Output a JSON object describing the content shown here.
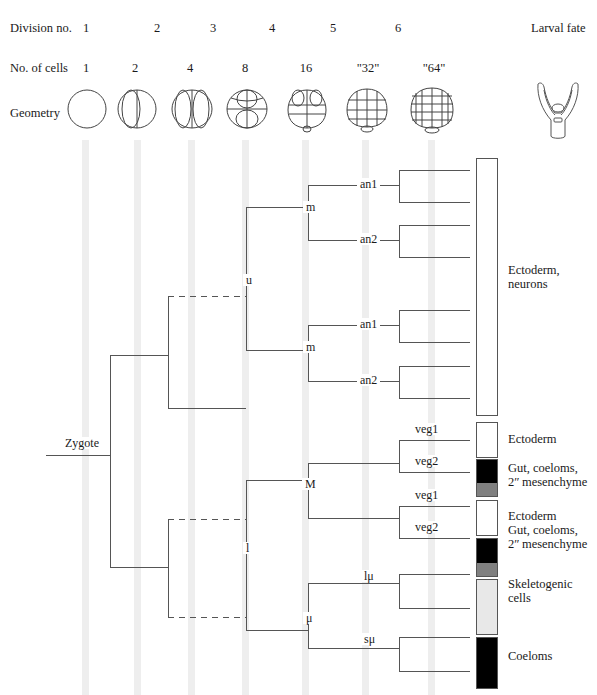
{
  "header": {
    "row_labels": {
      "division": "Division no.",
      "cells": "No. of cells",
      "geometry": "Geometry",
      "larval_fate": "Larval fate"
    },
    "division_numbers": [
      "1",
      "2",
      "3",
      "4",
      "5",
      "6"
    ],
    "cell_counts": [
      "1",
      "2",
      "4",
      "8",
      "16",
      "\"32\"",
      "\"64\""
    ]
  },
  "tree": {
    "root_label": "Zygote",
    "nodes": [
      {
        "id": "u",
        "label": "u"
      },
      {
        "id": "l",
        "label": "l"
      },
      {
        "id": "m1",
        "label": "m"
      },
      {
        "id": "m2",
        "label": "m"
      },
      {
        "id": "M",
        "label": "M"
      },
      {
        "id": "mu",
        "label": "μ"
      }
    ],
    "tips": [
      {
        "id": "an1a",
        "label": "an1"
      },
      {
        "id": "an2a",
        "label": "an2"
      },
      {
        "id": "an1b",
        "label": "an1"
      },
      {
        "id": "an2b",
        "label": "an2"
      },
      {
        "id": "veg1a",
        "label": "veg1"
      },
      {
        "id": "veg2a",
        "label": "veg2"
      },
      {
        "id": "veg1b",
        "label": "veg1"
      },
      {
        "id": "veg2b",
        "label": "veg2"
      },
      {
        "id": "lmu",
        "label": "lμ"
      },
      {
        "id": "smu",
        "label": "sμ"
      }
    ]
  },
  "fate_legend": [
    {
      "id": "ecto-neurons",
      "label": "Ectoderm,\nneurons",
      "color": "#ffffff"
    },
    {
      "id": "ectoderm-1",
      "label": "Ectoderm",
      "color": "#ffffff"
    },
    {
      "id": "gut-1",
      "label": "Gut, coeloms,\n2ʺ mesenchyme",
      "color": "#000000",
      "color2": "#808080"
    },
    {
      "id": "ectoderm-2",
      "label": "Ectoderm",
      "color": "#ffffff"
    },
    {
      "id": "gut-2",
      "label": "Gut, coeloms,\n2ʺ mesenchyme",
      "color": "#000000",
      "color2": "#808080"
    },
    {
      "id": "skeletogenic",
      "label": "Skeletogenic\ncells",
      "color": "#e8e8e8"
    },
    {
      "id": "coeloms",
      "label": "Coeloms",
      "color": "#000000"
    }
  ],
  "colors": {
    "line": "#555555",
    "stripe": "#ebebeb",
    "text": "#1a1a1a"
  }
}
